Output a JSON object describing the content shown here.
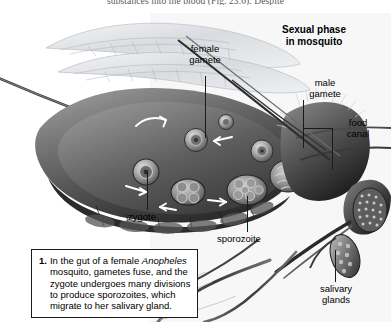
{
  "page": {
    "top_excerpt": "substances into the blood (Fig. 23.6).  Despite"
  },
  "figure": {
    "heading": "Sexual phase\nin mosquito",
    "labels": {
      "female_gamete": "female\ngamete",
      "male_gamete": "male\ngamete",
      "food_canal": "food\ncanal",
      "zygote": "zygote",
      "sporozoite": "sporozoite",
      "salivary_glands": "salivary\nglands"
    },
    "caption": {
      "number": "1.",
      "line1": "In the gut of a female ",
      "organism": "Anopheles",
      "line2": "mosquito, gametes fuse, and the",
      "line3": "zygote undergoes many divisions",
      "line4": "to produce sporozoites, which",
      "line5": "migrate to her salivary gland."
    }
  },
  "colors": {
    "ink": "#1a1a1a",
    "paper": "#ffffff",
    "body_dark": "#4a4a4a",
    "body_mid": "#8a8a8a",
    "body_light": "#c9c9c9",
    "wing": "#d8dade",
    "arrow": "#ffffff"
  }
}
